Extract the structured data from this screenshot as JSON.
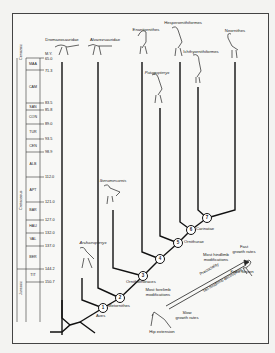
{
  "diagram": {
    "type": "phylogeny-time-tree",
    "timescale": {
      "unit_label": "M.Y.",
      "eras": [
        {
          "name": "Cenozoic"
        },
        {
          "name": "Cretaceous"
        },
        {
          "name": "Jurassic"
        }
      ],
      "stages": [
        "MAA",
        "CAM",
        "SAN",
        "CON",
        "TUR",
        "CEN",
        "ALB",
        "APT",
        "BAR",
        "HAU",
        "VAL",
        "BER",
        "TIT"
      ],
      "ticks": [
        "65.0",
        "71.3",
        "83.5",
        "85.8",
        "89.0",
        "93.5",
        "98.9",
        "112.0",
        "121.0",
        "127.0",
        "132.0",
        "137.0",
        "144.2",
        "150.7"
      ]
    },
    "taxa": [
      {
        "name": "Dromaeosauridae",
        "italic": false
      },
      {
        "name": "Alvarezsauridae",
        "italic": false
      },
      {
        "name": "Enantiornithes",
        "italic": false
      },
      {
        "name": "Hesperornithiformes",
        "italic": false
      },
      {
        "name": "Ichthyornithiformes",
        "italic": false
      },
      {
        "name": "Neornithes",
        "italic": false
      },
      {
        "name": "Patagopteryx",
        "italic": true
      },
      {
        "name": "Iberomesornis",
        "italic": true
      },
      {
        "name": "Archaeopteryx",
        "italic": true
      }
    ],
    "nodes": [
      {
        "number": "1",
        "label": "Aves"
      },
      {
        "number": "2",
        "label": "Metornithes"
      },
      {
        "number": "3",
        "label": "Ornithothoraces"
      },
      {
        "number": "4",
        "label": ""
      },
      {
        "number": "5",
        "label": "Ornithurae"
      },
      {
        "number": "6",
        "label": "Carinatae"
      },
      {
        "number": "7",
        "label": ""
      }
    ],
    "annotations": {
      "hip_extension": "Hip extension",
      "slow_growth": "Slow\ngrowth rates",
      "most_forelimb": "Most forelimb\nmodifications",
      "tail_hindlimb": "Tail-hindlimb decoupling",
      "precociality": "Precociality",
      "most_hindlimb": "Most hindlimb\nmodifications",
      "fast_growth": "Fast\ngrowth rates",
      "knee_flexion": "Knee flexion"
    }
  }
}
